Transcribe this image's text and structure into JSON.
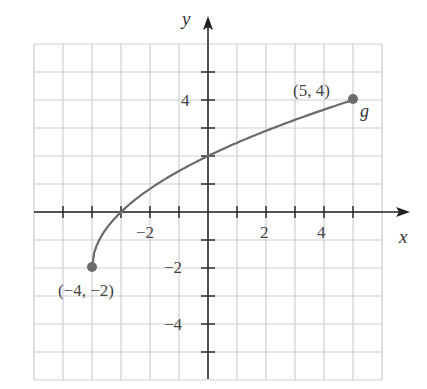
{
  "chart_data": {
    "type": "line",
    "title": "",
    "xlabel": "x",
    "ylabel": "y",
    "xlim": [
      -6,
      6
    ],
    "ylim": [
      -6,
      6
    ],
    "grid": true,
    "x_ticks": [
      -2,
      2,
      4
    ],
    "y_ticks": [
      4,
      -2,
      -4
    ],
    "tick_labels": {
      "x": [
        "−2",
        "2",
        "4"
      ],
      "y": [
        "4",
        "−2",
        "−4"
      ]
    },
    "series": [
      {
        "name": "g",
        "function": "g(x) = 2√(x+4) − 2",
        "x": [
          -4,
          -3,
          -2,
          -1,
          0,
          1,
          2,
          3,
          4,
          5
        ],
        "y": [
          -2,
          0,
          0.83,
          1.47,
          2,
          2.47,
          2.9,
          3.29,
          3.66,
          4
        ]
      }
    ],
    "annotations": [
      {
        "label": "(−4, −2)",
        "x": -4,
        "y": -2
      },
      {
        "label": "(5, 4)",
        "x": 5,
        "y": 4
      },
      {
        "label": "g",
        "x": 5,
        "y": 4
      }
    ],
    "colors": {
      "curve": "#6b6b6b",
      "grid": "#cfcfcf",
      "axis": "#222222"
    }
  },
  "labels": {
    "x_axis": "x",
    "y_axis": "y",
    "point_start": "(−4, −2)",
    "point_end": "(5, 4)",
    "function_name": "g",
    "xt_neg2": "−2",
    "xt_2": "2",
    "xt_4": "4",
    "yt_4": "4",
    "yt_neg2": "−2",
    "yt_neg4": "−4"
  }
}
